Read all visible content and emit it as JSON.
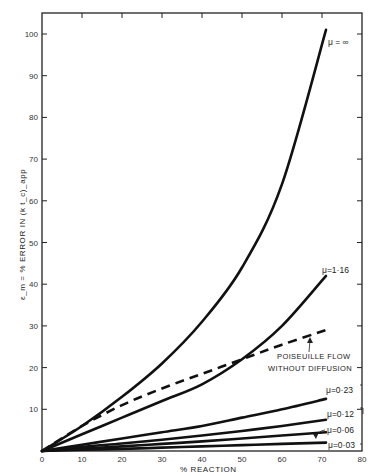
{
  "chart_data": {
    "type": "line",
    "title": "",
    "xlabel": "% REACTION",
    "ylabel": "ε_m = % ERROR IN (k t_c)_app",
    "xlim": [
      0,
      80
    ],
    "ylim": [
      0,
      105
    ],
    "grid": false,
    "legend": "inline labels at curve ends",
    "x_ticks": [
      0,
      10,
      20,
      30,
      40,
      50,
      60,
      70,
      80
    ],
    "y_ticks": [
      10,
      20,
      30,
      40,
      50,
      60,
      70,
      80,
      90,
      100
    ],
    "series": [
      {
        "name": "μ=∞",
        "style": "solid",
        "x": [
          0,
          10,
          20,
          30,
          40,
          50,
          60,
          71
        ],
        "y": [
          0,
          6,
          13,
          21,
          31,
          44,
          64,
          101
        ]
      },
      {
        "name": "μ=1·16",
        "style": "solid",
        "x": [
          0,
          10,
          20,
          30,
          40,
          50,
          60,
          71
        ],
        "y": [
          0,
          4,
          8,
          12,
          16,
          22,
          30,
          42
        ]
      },
      {
        "name": "POISEUILLE FLOW WITHOUT DIFFUSION",
        "style": "dashed",
        "x": [
          0,
          10,
          20,
          30,
          40,
          50,
          60,
          71
        ],
        "y": [
          0,
          6,
          11,
          15,
          18.5,
          22,
          25.5,
          29
        ]
      },
      {
        "name": "μ=0·23",
        "style": "solid",
        "x": [
          0,
          10,
          20,
          30,
          40,
          50,
          60,
          71
        ],
        "y": [
          0,
          1.5,
          3,
          4.5,
          6,
          8,
          10,
          12.5
        ]
      },
      {
        "name": "μ=0·12",
        "style": "solid",
        "x": [
          0,
          10,
          20,
          30,
          40,
          50,
          60,
          71
        ],
        "y": [
          0,
          1,
          1.8,
          2.7,
          3.7,
          4.8,
          6,
          7.5
        ]
      },
      {
        "name": "μ=0·06",
        "style": "solid",
        "x": [
          0,
          10,
          20,
          30,
          40,
          50,
          60,
          71
        ],
        "y": [
          0,
          0.6,
          1.1,
          1.7,
          2.3,
          3,
          3.7,
          4.5
        ]
      },
      {
        "name": "μ=0·03",
        "style": "solid",
        "x": [
          0,
          10,
          20,
          30,
          40,
          50,
          60,
          71
        ],
        "y": [
          0,
          0.3,
          0.5,
          0.8,
          1.1,
          1.4,
          1.7,
          2
        ]
      }
    ],
    "annotations": [
      "POISEUILLE FLOW",
      "WITHOUT DIFFUSION"
    ]
  },
  "labels": {
    "xlabel": "% REACTION",
    "ylabel": "ε_m = % ERROR IN (k t_c)_app",
    "mu_inf": "μ = ∞",
    "mu_116": "μ=1·16",
    "mu_023": "μ=0·23",
    "mu_012": "μ=0·12",
    "mu_006": "μ=0·06",
    "mu_003": "μ=0·03",
    "ann1": "POISEUILLE FLOW",
    "ann2": "WITHOUT DIFFUSION"
  },
  "x_tick_labels": [
    "0",
    "10",
    "20",
    "30",
    "40",
    "50",
    "60",
    "70",
    "80"
  ],
  "y_tick_labels": [
    "10",
    "20",
    "30",
    "40",
    "50",
    "60",
    "70",
    "80",
    "90",
    "100"
  ]
}
